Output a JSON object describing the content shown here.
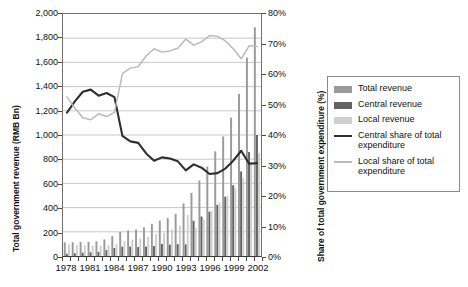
{
  "chart_data": {
    "type": "bar",
    "title": "",
    "xlabel": "",
    "ylabel": "Total government revenue (RMB Bn)",
    "y2label": "Share of total government expenditure (%)",
    "x": [
      1978,
      1979,
      1980,
      1981,
      1982,
      1983,
      1984,
      1985,
      1986,
      1987,
      1988,
      1989,
      1990,
      1991,
      1992,
      1993,
      1994,
      1995,
      1996,
      1997,
      1998,
      1999,
      2000,
      2001,
      2002
    ],
    "xtick_labels": [
      "1978",
      "1981",
      "1984",
      "1987",
      "1990",
      "1993",
      "1996",
      "1999",
      "2002"
    ],
    "ylim": [
      0,
      2000
    ],
    "yticks": [
      "0",
      "200",
      "400",
      "600",
      "800",
      "1,000",
      "1,200",
      "1,400",
      "1,600",
      "1,800",
      "2,000"
    ],
    "y2lim": [
      0,
      80
    ],
    "y2ticks": [
      "0%",
      "10%",
      "20%",
      "30%",
      "40%",
      "50%",
      "60%",
      "70%",
      "80%"
    ],
    "grid": true,
    "legend_position": "right",
    "series": [
      {
        "name": "Total revenue",
        "type": "bar",
        "axis": "left",
        "color": "#9a9a9a",
        "values": [
          113,
          114,
          116,
          117,
          121,
          137,
          164,
          200,
          212,
          219,
          236,
          266,
          293,
          314,
          348,
          435,
          522,
          624,
          740,
          865,
          988,
          1144,
          1340,
          1640,
          1890
        ]
      },
      {
        "name": "Central revenue",
        "type": "bar",
        "axis": "left",
        "color": "#636363",
        "values": [
          18,
          23,
          28,
          31,
          35,
          49,
          66,
          77,
          78,
          74,
          78,
          82,
          99,
          94,
          98,
          96,
          291,
          326,
          366,
          423,
          490,
          585,
          699,
          859,
          1000
        ]
      },
      {
        "name": "Local revenue",
        "type": "bar",
        "axis": "left",
        "color": "#cfcfcf",
        "values": [
          95,
          91,
          88,
          86,
          86,
          88,
          98,
          123,
          134,
          145,
          158,
          184,
          194,
          220,
          250,
          339,
          231,
          298,
          374,
          442,
          498,
          559,
          641,
          781,
          851
        ]
      },
      {
        "name": "Central share of total expenditure",
        "type": "line",
        "axis": "right",
        "color": "#2e2e2e",
        "values": [
          47.4,
          51.1,
          54.3,
          55.0,
          53.0,
          53.9,
          52.5,
          39.7,
          37.9,
          37.4,
          33.9,
          31.5,
          32.6,
          32.2,
          31.3,
          28.3,
          30.3,
          29.2,
          27.1,
          27.4,
          28.9,
          31.5,
          34.8,
          30.5,
          30.7
        ]
      },
      {
        "name": "Local share of total expenditure",
        "type": "line",
        "axis": "right",
        "color": "#b9b9b9",
        "values": [
          52.6,
          48.9,
          45.7,
          45.0,
          47.0,
          46.1,
          47.5,
          60.3,
          62.1,
          62.6,
          66.1,
          68.5,
          67.4,
          67.8,
          68.7,
          71.7,
          69.7,
          70.8,
          72.9,
          72.6,
          71.1,
          68.5,
          65.2,
          69.5,
          69.3
        ]
      }
    ]
  },
  "axes": {
    "left_title": "Total government revenue (RMB Bn)",
    "right_title": "Share of total government expenditure (%)"
  },
  "legend": {
    "items": [
      {
        "label": "Total revenue",
        "swatch": "bar",
        "color": "#9a9a9a"
      },
      {
        "label": "Central revenue",
        "swatch": "bar",
        "color": "#636363"
      },
      {
        "label": "Local revenue",
        "swatch": "bar",
        "color": "#cfcfcf"
      },
      {
        "label": "Central share of total expenditure",
        "swatch": "line",
        "color": "#2e2e2e"
      },
      {
        "label": "Local share of total expenditure",
        "swatch": "line",
        "color": "#b9b9b9"
      }
    ]
  }
}
